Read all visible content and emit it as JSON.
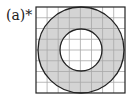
{
  "figure": {
    "label": "(a)*",
    "grid": {
      "rows": 8,
      "cols": 8
    },
    "shape": "annulus",
    "colors": {
      "fill": "#d4d4d4",
      "grid": "#a8a8a8",
      "outline": "#222222",
      "background": "#ffffff"
    }
  }
}
